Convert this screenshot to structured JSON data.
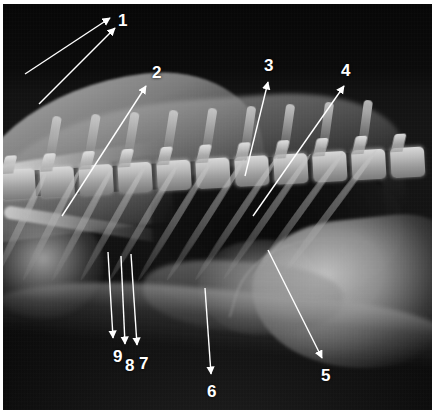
{
  "figure": {
    "kind": "annotated-radiograph",
    "modality": "x-ray",
    "view": "lateral thorax",
    "width": 435,
    "height": 415,
    "background_color": "#ffffff",
    "film_color": "#0a0a0a",
    "annotation_color": "#ffffff"
  },
  "annotations": [
    {
      "id": "1",
      "label": "1",
      "label_x": 118,
      "label_y": 12,
      "leaders": [
        {
          "x1": 25,
          "y1": 74,
          "x2": 110,
          "y2": 18
        },
        {
          "x1": 39,
          "y1": 104,
          "x2": 115,
          "y2": 28
        }
      ]
    },
    {
      "id": "2",
      "label": "2",
      "label_x": 152,
      "label_y": 64,
      "leaders": [
        {
          "x1": 62,
          "y1": 216,
          "x2": 146,
          "y2": 86
        }
      ]
    },
    {
      "id": "3",
      "label": "3",
      "label_x": 264,
      "label_y": 57,
      "leaders": [
        {
          "x1": 245,
          "y1": 176,
          "x2": 268,
          "y2": 82
        }
      ]
    },
    {
      "id": "4",
      "label": "4",
      "label_x": 341,
      "label_y": 62,
      "leaders": [
        {
          "x1": 253,
          "y1": 216,
          "x2": 344,
          "y2": 86
        }
      ]
    },
    {
      "id": "5",
      "label": "5",
      "label_x": 321,
      "label_y": 367,
      "leaders": [
        {
          "x1": 268,
          "y1": 250,
          "x2": 322,
          "y2": 358
        }
      ]
    },
    {
      "id": "6",
      "label": "6",
      "label_x": 207,
      "label_y": 383,
      "leaders": [
        {
          "x1": 205,
          "y1": 288,
          "x2": 211,
          "y2": 374
        }
      ]
    },
    {
      "id": "7",
      "label": "7",
      "label_x": 139,
      "label_y": 355,
      "leaders": [
        {
          "x1": 131,
          "y1": 254,
          "x2": 137,
          "y2": 345
        }
      ]
    },
    {
      "id": "8",
      "label": "8",
      "label_x": 125,
      "label_y": 357,
      "leaders": [
        {
          "x1": 121,
          "y1": 256,
          "x2": 125,
          "y2": 344
        }
      ]
    },
    {
      "id": "9",
      "label": "9",
      "label_x": 113,
      "label_y": 348,
      "leaders": [
        {
          "x1": 108,
          "y1": 252,
          "x2": 113,
          "y2": 338
        }
      ]
    }
  ],
  "anatomy": {
    "vertebrae_count": 11,
    "ribs_count": 11,
    "spinous_process_count": 9
  }
}
